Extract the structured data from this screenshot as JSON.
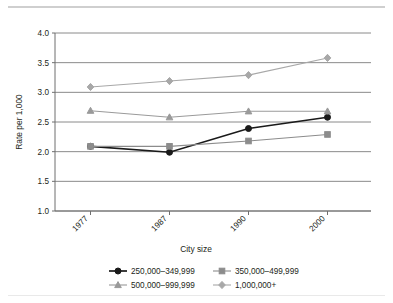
{
  "chart_data": {
    "type": "line",
    "title": "",
    "xlabel": "City size",
    "ylabel": "Rate per 1,000",
    "categories": [
      "1977",
      "1987",
      "1990",
      "2000"
    ],
    "ylim": [
      1.0,
      4.0
    ],
    "yticks": [
      "1.0",
      "1.5",
      "2.0",
      "2.5",
      "3.0",
      "3.5",
      "4.0"
    ],
    "ytick_values": [
      1.0,
      1.5,
      2.0,
      2.5,
      3.0,
      3.5,
      4.0
    ],
    "grid": "horizontal",
    "legend_position": "bottom",
    "series": [
      {
        "name": "250,000–349,999",
        "marker": "circle",
        "color": "#1a1a1a",
        "values": [
          2.09,
          1.99,
          2.39,
          2.58
        ]
      },
      {
        "name": "350,000–499,999",
        "marker": "square",
        "color": "#8c8c8c",
        "values": [
          2.09,
          2.09,
          2.18,
          2.29
        ]
      },
      {
        "name": "500,000–999,999",
        "marker": "triangle",
        "color": "#9a9a9a",
        "values": [
          2.69,
          2.58,
          2.68,
          2.68
        ]
      },
      {
        "name": "1,000,000+",
        "marker": "diamond",
        "color": "#a8a8a8",
        "values": [
          3.09,
          3.19,
          3.29,
          3.58
        ]
      }
    ]
  }
}
